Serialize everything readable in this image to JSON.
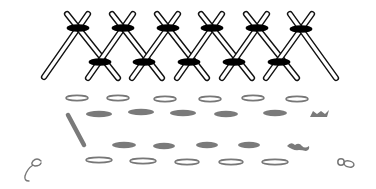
{
  "diagram": {
    "colors": {
      "background": "#ffffff",
      "stitch_outline": "#111111",
      "tie_bar": "#000000",
      "dash_gray": "#7a7a7a",
      "dash_outline": "#777777"
    },
    "top_band": {
      "top_crossings": [
        {
          "x": 78,
          "y": 28
        },
        {
          "x": 123,
          "y": 28
        },
        {
          "x": 168,
          "y": 28
        },
        {
          "x": 212,
          "y": 28
        },
        {
          "x": 257,
          "y": 28
        },
        {
          "x": 301,
          "y": 29
        }
      ],
      "bottom_crossings": [
        {
          "x": 100,
          "y": 62
        },
        {
          "x": 144,
          "y": 62
        },
        {
          "x": 189,
          "y": 62
        },
        {
          "x": 234,
          "y": 62
        },
        {
          "x": 279,
          "y": 62
        }
      ],
      "diagonals": [
        {
          "x1": 44,
          "y1": 77,
          "x2": 88,
          "y2": 14
        },
        {
          "x1": 67,
          "y1": 14,
          "x2": 118,
          "y2": 78
        },
        {
          "x1": 88,
          "y1": 78,
          "x2": 133,
          "y2": 14
        },
        {
          "x1": 112,
          "y1": 14,
          "x2": 162,
          "y2": 78
        },
        {
          "x1": 132,
          "y1": 78,
          "x2": 178,
          "y2": 14
        },
        {
          "x1": 157,
          "y1": 14,
          "x2": 207,
          "y2": 78
        },
        {
          "x1": 177,
          "y1": 78,
          "x2": 222,
          "y2": 14
        },
        {
          "x1": 201,
          "y1": 14,
          "x2": 252,
          "y2": 78
        },
        {
          "x1": 222,
          "y1": 78,
          "x2": 267,
          "y2": 14
        },
        {
          "x1": 246,
          "y1": 14,
          "x2": 297,
          "y2": 78
        },
        {
          "x1": 266,
          "y1": 78,
          "x2": 312,
          "y2": 14
        },
        {
          "x1": 290,
          "y1": 14,
          "x2": 336,
          "y2": 78
        }
      ]
    },
    "bottom_band": {
      "outline_row_top": [
        {
          "cx": 77,
          "cy": 98,
          "w": 22
        },
        {
          "cx": 118,
          "cy": 98,
          "w": 22
        },
        {
          "cx": 165,
          "cy": 99,
          "w": 22
        },
        {
          "cx": 210,
          "cy": 99,
          "w": 22
        },
        {
          "cx": 253,
          "cy": 98,
          "w": 22
        },
        {
          "cx": 297,
          "cy": 99,
          "w": 22
        }
      ],
      "filled_row_upper": [
        {
          "cx": 99,
          "cy": 114,
          "w": 26
        },
        {
          "cx": 141,
          "cy": 112,
          "w": 26
        },
        {
          "cx": 183,
          "cy": 113,
          "w": 26
        },
        {
          "cx": 226,
          "cy": 114,
          "w": 24
        },
        {
          "cx": 275,
          "cy": 113,
          "w": 24
        }
      ],
      "filled_row_lower": [
        {
          "cx": 124,
          "cy": 145,
          "w": 24
        },
        {
          "cx": 164,
          "cy": 146,
          "w": 22
        },
        {
          "cx": 207,
          "cy": 145,
          "w": 22
        },
        {
          "cx": 249,
          "cy": 145,
          "w": 22
        }
      ],
      "outline_row_bottom": [
        {
          "cx": 99,
          "cy": 160,
          "w": 26
        },
        {
          "cx": 143,
          "cy": 161,
          "w": 26
        },
        {
          "cx": 187,
          "cy": 162,
          "w": 24
        },
        {
          "cx": 231,
          "cy": 162,
          "w": 24
        },
        {
          "cx": 275,
          "cy": 162,
          "w": 26
        }
      ],
      "slanted_bar": {
        "x1": 68,
        "y1": 115,
        "x2": 84,
        "y2": 145
      },
      "small_squiggle_upper_right": {
        "cx": 320,
        "cy": 114
      },
      "small_squiggle_lower_right": {
        "cx": 297,
        "cy": 148
      }
    },
    "decorations": {
      "left_curl": {
        "cx": 33,
        "cy": 171
      },
      "right_loop": {
        "cx": 345,
        "cy": 163
      }
    }
  }
}
